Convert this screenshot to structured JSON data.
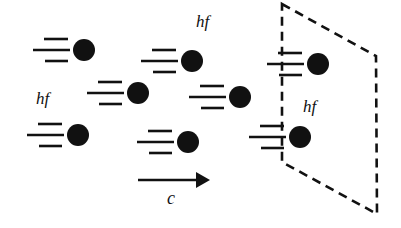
{
  "diagram": {
    "colors": {
      "ink": "#111111",
      "background": "#ffffff"
    },
    "labels": [
      {
        "id": "hf-top",
        "text": "hf",
        "x": 196,
        "y": 27,
        "size": 17
      },
      {
        "id": "hf-left",
        "text": "hf",
        "x": 36,
        "y": 104,
        "size": 17
      },
      {
        "id": "hf-plane",
        "text": "hf",
        "x": 303,
        "y": 112,
        "size": 17
      },
      {
        "id": "speed-c",
        "text": "c",
        "x": 167,
        "y": 204,
        "size": 18
      }
    ],
    "arrow": {
      "x1": 138,
      "y1": 180,
      "x2": 210,
      "y2": 180,
      "label": "c"
    },
    "plane": {
      "style": "dashed",
      "points": [
        [
          282,
          4
        ],
        [
          376,
          56
        ],
        [
          377,
          214
        ],
        [
          282,
          162
        ]
      ]
    },
    "photons": [
      {
        "id": "photon-1",
        "cx": 84,
        "cy": 50,
        "r": 11
      },
      {
        "id": "photon-2",
        "cx": 192,
        "cy": 61,
        "r": 11
      },
      {
        "id": "photon-3",
        "cx": 138,
        "cy": 93,
        "r": 11
      },
      {
        "id": "photon-4",
        "cx": 240,
        "cy": 97,
        "r": 11
      },
      {
        "id": "photon-5",
        "cx": 78,
        "cy": 135,
        "r": 11
      },
      {
        "id": "photon-6",
        "cx": 188,
        "cy": 142,
        "r": 11
      },
      {
        "id": "photon-7",
        "cx": 318,
        "cy": 64,
        "r": 11
      },
      {
        "id": "photon-8",
        "cx": 300,
        "cy": 137,
        "r": 11
      }
    ]
  }
}
